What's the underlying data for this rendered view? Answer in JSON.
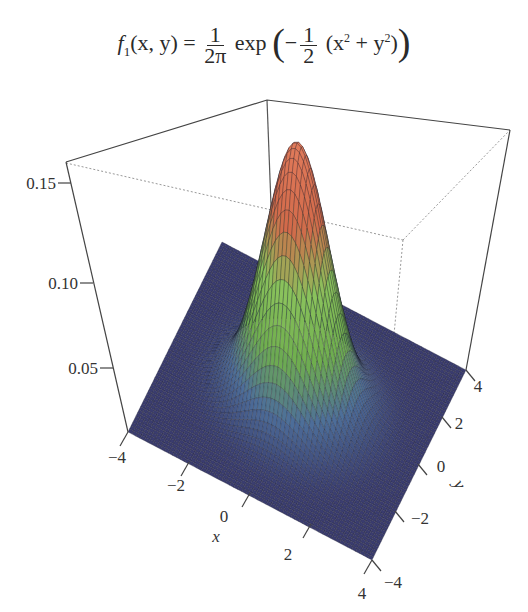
{
  "chart_data": {
    "type": "surface3d",
    "title_parts": {
      "lhs": "f",
      "lhs_sub": "1",
      "args": "(x, y) =",
      "frac1_num": "1",
      "frac1_den": "2π",
      "exp": "exp",
      "minus": "−",
      "frac2_num": "1",
      "frac2_den": "2",
      "inner": "(x",
      "sq1": "2",
      "plus": " + y",
      "sq2": "2",
      "close": ")"
    },
    "function": "bivariate standard normal density",
    "x": {
      "label": "x",
      "range": [
        -4,
        4
      ],
      "ticks": [
        "-4",
        "-2",
        "0",
        "2",
        "4"
      ]
    },
    "y": {
      "label": "y",
      "range": [
        -4,
        4
      ],
      "ticks": [
        "-4",
        "-2",
        "0",
        "2",
        "4"
      ]
    },
    "z": {
      "label": "",
      "range": [
        0,
        0.16
      ],
      "ticks": [
        "0.05",
        "0.10",
        "0.15"
      ]
    },
    "peak": {
      "x": 0,
      "y": 0,
      "z": 0.159
    },
    "colormap": [
      "#3a3c6e",
      "#4d6e9a",
      "#6fae4e",
      "#8ac25c",
      "#d26a4a",
      "#e07a5a"
    ],
    "box": true,
    "grid": false
  },
  "labels": {
    "z_ticks": [
      "0.15",
      "0.10",
      "0.05"
    ],
    "x_ticks": [
      "−4",
      "−2",
      "0",
      "2",
      "4"
    ],
    "y_ticks": [
      "4",
      "2",
      "0",
      "−2",
      "−4"
    ],
    "x_axis": "x",
    "y_axis": "y"
  }
}
